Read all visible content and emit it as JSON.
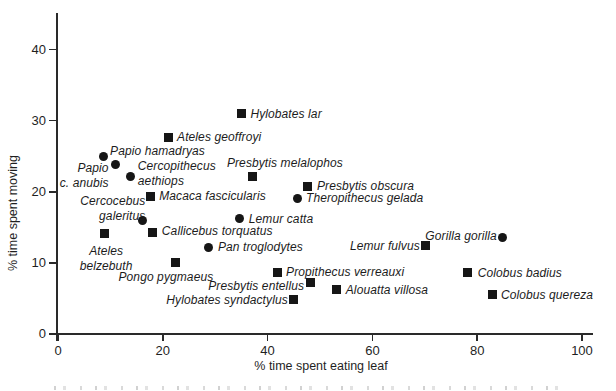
{
  "colors": {
    "ink": "#1a1a1a",
    "background": "#ffffff"
  },
  "chart_data": {
    "type": "scatter",
    "title": "",
    "xlabel": "% time spent eating leaf",
    "ylabel": "% time spent moving",
    "xlim": [
      0,
      102
    ],
    "ylim": [
      0,
      45
    ],
    "x_ticks": [
      0,
      20,
      40,
      60,
      80,
      100
    ],
    "y_ticks": [
      0,
      10,
      20,
      30,
      40
    ],
    "grid": false,
    "marker_shapes": [
      "square",
      "circle"
    ],
    "points": [
      {
        "species": "Hylobates lar",
        "x": 35.0,
        "y": 31.0,
        "marker": "square",
        "label": {
          "lines": [
            "Hylobates lar"
          ],
          "anchor": "start",
          "dx": 9,
          "dy": -7
        }
      },
      {
        "species": "Ateles geoffroyi",
        "x": 21.0,
        "y": 27.7,
        "marker": "square",
        "label": {
          "lines": [
            "Ateles geoffroyi"
          ],
          "anchor": "start",
          "dx": 9,
          "dy": -7
        }
      },
      {
        "species": "Papio hamadryas",
        "x": 8.6,
        "y": 25.0,
        "marker": "circle",
        "label": {
          "lines": [
            "Papio hamadryas"
          ],
          "anchor": "start",
          "dx": 7,
          "dy": -12
        }
      },
      {
        "species": "Papio c. anubis",
        "x": 11.0,
        "y": 23.8,
        "marker": "circle",
        "label": {
          "lines": [
            "Papio",
            "c. anubis"
          ],
          "anchor": "end",
          "dx": -7,
          "dy": -4
        }
      },
      {
        "species": "Cercopithecus aethiops",
        "x": 13.9,
        "y": 22.1,
        "marker": "circle",
        "label": {
          "lines": [
            "Cercopithecus",
            "aethiops"
          ],
          "anchor": "start",
          "dx": 7,
          "dy": -18
        }
      },
      {
        "species": "Presbytis melalophos",
        "x": 37.2,
        "y": 22.2,
        "marker": "square",
        "label": {
          "lines": [
            "Presbytis melalophos"
          ],
          "anchor": "start",
          "dx": -26,
          "dy": -20
        }
      },
      {
        "species": "Presbytis obscura",
        "x": 47.7,
        "y": 20.8,
        "marker": "square",
        "label": {
          "lines": [
            "Presbytis obscura"
          ],
          "anchor": "start",
          "dx": 9,
          "dy": -7
        }
      },
      {
        "species": "Macaca fascicularis",
        "x": 17.6,
        "y": 19.3,
        "marker": "square",
        "label": {
          "lines": [
            "Macaca fascicularis"
          ],
          "anchor": "start",
          "dx": 9,
          "dy": -8
        }
      },
      {
        "species": "Theropithecus gelada",
        "x": 45.8,
        "y": 19.1,
        "marker": "circle",
        "label": {
          "lines": [
            "Theropithecus gelada"
          ],
          "anchor": "start",
          "dx": 8,
          "dy": -7
        }
      },
      {
        "species": "Cercocebus galeritus",
        "x": 16.1,
        "y": 16.0,
        "marker": "circle",
        "label": {
          "lines": [
            "Cercocebus",
            "galeritus"
          ],
          "anchor": "end",
          "dx": 3,
          "dy": -26
        }
      },
      {
        "species": "Lemur catta",
        "x": 34.7,
        "y": 16.2,
        "marker": "circle",
        "label": {
          "lines": [
            "Lemur catta"
          ],
          "anchor": "start",
          "dx": 9,
          "dy": -7
        }
      },
      {
        "species": "Callicebus torquatus",
        "x": 18.1,
        "y": 14.3,
        "marker": "square",
        "label": {
          "lines": [
            "Callicebus torquatus"
          ],
          "anchor": "start",
          "dx": 9,
          "dy": -8
        }
      },
      {
        "species": "Ateles belzebuth",
        "x": 8.8,
        "y": 14.2,
        "marker": "square",
        "label": {
          "lines": [
            "Ateles",
            "belzebuth"
          ],
          "anchor": "center",
          "dx": 2,
          "dy": 11
        }
      },
      {
        "species": "Pan troglodytes",
        "x": 28.8,
        "y": 12.1,
        "marker": "circle",
        "label": {
          "lines": [
            "Pan troglodytes"
          ],
          "anchor": "start",
          "dx": 9,
          "dy": -8
        }
      },
      {
        "species": "Pongo pygmaeus",
        "x": 22.5,
        "y": 10.1,
        "marker": "square",
        "label": {
          "lines": [
            "Pongo pygmaeus"
          ],
          "anchor": "center",
          "dx": -10,
          "dy": 8
        }
      },
      {
        "species": "Gorilla gorilla",
        "x": 84.9,
        "y": 13.6,
        "marker": "circle",
        "label": {
          "lines": [
            "Gorilla gorilla"
          ],
          "anchor": "end",
          "dx": -6,
          "dy": -8
        }
      },
      {
        "species": "Lemur fulvus",
        "x": 70.2,
        "y": 12.4,
        "marker": "square",
        "label": {
          "lines": [
            "Lemur fulvus"
          ],
          "anchor": "end",
          "dx": -6,
          "dy": -7
        }
      },
      {
        "species": "Propithecus verreauxi",
        "x": 41.8,
        "y": 8.6,
        "marker": "square",
        "label": {
          "lines": [
            "Propithecus verreauxi"
          ],
          "anchor": "start",
          "dx": 9,
          "dy": -8
        }
      },
      {
        "species": "Presbytis entellus",
        "x": 48.1,
        "y": 7.2,
        "marker": "square",
        "label": {
          "lines": [
            "Presbytis entellus"
          ],
          "anchor": "end",
          "dx": -6,
          "dy": -4
        }
      },
      {
        "species": "Alouatta villosa",
        "x": 53.2,
        "y": 6.3,
        "marker": "square",
        "label": {
          "lines": [
            "Alouatta villosa"
          ],
          "anchor": "start",
          "dx": 9,
          "dy": -6
        }
      },
      {
        "species": "Colobus badius",
        "x": 78.2,
        "y": 8.6,
        "marker": "square",
        "label": {
          "lines": [
            "Colobus badius"
          ],
          "anchor": "start",
          "dx": 10,
          "dy": -7
        }
      },
      {
        "species": "Colobus quereza",
        "x": 83.0,
        "y": 5.5,
        "marker": "square",
        "label": {
          "lines": [
            "Colobus quereza"
          ],
          "anchor": "start",
          "dx": 8,
          "dy": -7
        }
      },
      {
        "species": "Hylobates syndactylus",
        "x": 45.0,
        "y": 4.8,
        "marker": "square",
        "label": {
          "lines": [
            "Hylobates syndactylus"
          ],
          "anchor": "end",
          "dx": -6,
          "dy": -7
        }
      }
    ]
  }
}
